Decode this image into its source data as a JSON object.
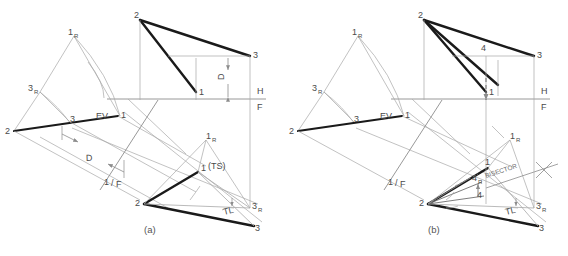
{
  "figure": {
    "captions": [
      {
        "id": "caption-a",
        "text": "(a)",
        "x": 144,
        "y": 233
      },
      {
        "id": "caption-b",
        "text": "(b)",
        "x": 428,
        "y": 233
      }
    ],
    "colors": {
      "heavy_line": "#1a1a1a",
      "light_line": "#8c8c8c",
      "thin_line": "#a8a8a8",
      "text": "#4a4a4a",
      "background": "#ffffff"
    }
  },
  "diagram_a": {
    "name": "part-a",
    "fold_lines": [
      {
        "label_top": "H",
        "label_bottom": "F",
        "x": 254,
        "y": 99
      },
      {
        "label": "1/F",
        "x": 108,
        "y": 182
      }
    ],
    "annotations": [
      {
        "id": "edge-view-label",
        "text": "EV",
        "x": 99,
        "y": 117
      },
      {
        "id": "true-size-label",
        "text": "(TS)",
        "x": 216,
        "y": 166
      },
      {
        "id": "true-length-label",
        "text": "TL",
        "x": 230,
        "y": 211
      },
      {
        "id": "dimension-d-horizontal",
        "text": "D",
        "x": 90,
        "y": 158
      },
      {
        "id": "dimension-d-vertical",
        "text": "D",
        "x": 228,
        "y": 76
      }
    ],
    "points": [
      {
        "id": "pt-1r-aux",
        "label": "1",
        "sub": "R",
        "x": 72,
        "y": 32
      },
      {
        "id": "pt-3r-aux",
        "label": "3",
        "sub": "R",
        "x": 34,
        "y": 88
      },
      {
        "id": "pt-2-front",
        "label": "2",
        "x": 8,
        "y": 130
      },
      {
        "id": "pt-3-front",
        "label": "3",
        "x": 73,
        "y": 120
      },
      {
        "id": "pt-1-front",
        "label": "1",
        "x": 120,
        "y": 117
      },
      {
        "id": "pt-2-top",
        "label": "2",
        "x": 138,
        "y": 14
      },
      {
        "id": "pt-3-top",
        "label": "3",
        "x": 253,
        "y": 53
      },
      {
        "id": "pt-1-top",
        "label": "1",
        "x": 198,
        "y": 91
      },
      {
        "id": "pt-1r-lower",
        "label": "1",
        "sub": "R",
        "x": 206,
        "y": 136
      },
      {
        "id": "pt-1-lower",
        "label": "1",
        "x": 200,
        "y": 170
      },
      {
        "id": "pt-2-lower",
        "label": "2",
        "x": 140,
        "y": 202
      },
      {
        "id": "pt-3r-lower",
        "label": "3",
        "sub": "R",
        "x": 256,
        "y": 206
      },
      {
        "id": "pt-3-lower",
        "label": "3",
        "x": 256,
        "y": 226
      }
    ]
  },
  "diagram_b": {
    "name": "part-b",
    "fold_lines": [
      {
        "label_top": "H",
        "label_bottom": "F",
        "x": 538,
        "y": 99
      },
      {
        "label": "1/F",
        "x": 390,
        "y": 182
      }
    ],
    "annotations": [
      {
        "id": "edge-view-label",
        "text": "EV",
        "x": 383,
        "y": 117
      },
      {
        "id": "bisector-label",
        "text": "BISECTOR",
        "x": 492,
        "y": 175
      },
      {
        "id": "true-length-label",
        "text": "TL",
        "x": 512,
        "y": 211
      }
    ],
    "points": [
      {
        "id": "pt-1r-aux",
        "label": "1",
        "sub": "R",
        "x": 356,
        "y": 32
      },
      {
        "id": "pt-3r-aux",
        "label": "3",
        "sub": "R",
        "x": 318,
        "y": 88
      },
      {
        "id": "pt-2-front",
        "label": "2",
        "x": 292,
        "y": 130
      },
      {
        "id": "pt-3-front",
        "label": "3",
        "x": 357,
        "y": 120
      },
      {
        "id": "pt-1-front",
        "label": "1",
        "x": 404,
        "y": 117
      },
      {
        "id": "pt-2-top",
        "label": "2",
        "x": 422,
        "y": 14
      },
      {
        "id": "pt-4-top",
        "label": "4",
        "x": 483,
        "y": 47
      },
      {
        "id": "pt-3-top",
        "label": "3",
        "x": 537,
        "y": 53
      },
      {
        "id": "pt-1-top",
        "label": "1",
        "x": 490,
        "y": 91
      },
      {
        "id": "pt-1r-lower",
        "label": "1",
        "sub": "R",
        "x": 510,
        "y": 136
      },
      {
        "id": "pt-1-lower",
        "label": "1",
        "x": 484,
        "y": 162
      },
      {
        "id": "pt-4r-lower",
        "label": "4",
        "sub": "R",
        "x": 478,
        "y": 178
      },
      {
        "id": "pt-4-lower",
        "label": "4",
        "x": 480,
        "y": 194
      },
      {
        "id": "pt-2-lower",
        "label": "2",
        "x": 424,
        "y": 202
      },
      {
        "id": "pt-3r-lower",
        "label": "3",
        "sub": "R",
        "x": 540,
        "y": 206
      },
      {
        "id": "pt-3-lower",
        "label": "3",
        "x": 540,
        "y": 226
      }
    ]
  }
}
